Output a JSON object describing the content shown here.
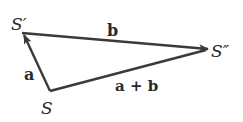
{
  "diagram": {
    "type": "vector-addition-triangle",
    "colors": {
      "stroke": "#3a3a3a",
      "text": "#2a2a2a",
      "background": "#ffffff"
    },
    "points": {
      "S": {
        "label": "S"
      },
      "S_prime": {
        "label": "S′"
      },
      "S_double_prime": {
        "label": "S″"
      }
    },
    "vectors": {
      "a": {
        "label": "a",
        "from": "S",
        "to": "S′"
      },
      "b": {
        "label": "b",
        "from": "S′",
        "to": "S″"
      },
      "a_plus_b": {
        "label": "a + b",
        "from": "S",
        "to": "S″"
      }
    }
  }
}
